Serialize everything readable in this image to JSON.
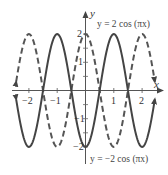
{
  "chart_data": {
    "type": "line",
    "title": "",
    "xlabel": "x",
    "ylabel": "y",
    "xlim": [
      -2.45,
      2.45
    ],
    "ylim": [
      -2,
      2
    ],
    "x_ticks": [
      -2,
      -1,
      1,
      2
    ],
    "y_ticks": [
      2,
      1,
      -1,
      -2
    ],
    "x_tick_labels": [
      "−2",
      "−1",
      "1",
      "2"
    ],
    "y_tick_labels": [
      "2",
      "1",
      "−1",
      "−2"
    ],
    "grid": false,
    "series": [
      {
        "name": "y = 2 cos (πx)",
        "style": "dashed",
        "color": "#555555",
        "x": [
          -2.45,
          -2,
          -1.5,
          -1,
          -0.5,
          0,
          0.5,
          1,
          1.5,
          2,
          2.45
        ],
        "values": [
          0.31,
          2,
          0,
          -2,
          0,
          2,
          0,
          -2,
          0,
          2,
          0.31
        ]
      },
      {
        "name": "y = −2 cos (πx)",
        "style": "solid",
        "color": "#444444",
        "x": [
          -2.45,
          -2,
          -1.5,
          -1,
          -0.5,
          0,
          0.5,
          1,
          1.5,
          2,
          2.45
        ],
        "values": [
          -0.31,
          -2,
          0,
          2,
          0,
          -2,
          0,
          2,
          0,
          -2,
          -0.31
        ]
      }
    ],
    "annotations": [
      {
        "text": "y = 2 cos (πx)",
        "position": "top-right"
      },
      {
        "text": "y = −2 cos (πx)",
        "position": "bottom-right"
      }
    ]
  },
  "labels": {
    "x_axis": "x",
    "y_axis": "y",
    "eq_top": "y = 2 cos (πx)",
    "eq_bottom": "y = −2 cos (πx)",
    "xt": [
      "−2",
      "−1",
      "1",
      "2"
    ],
    "yt": [
      "2",
      "1",
      "−1",
      "−2"
    ]
  }
}
